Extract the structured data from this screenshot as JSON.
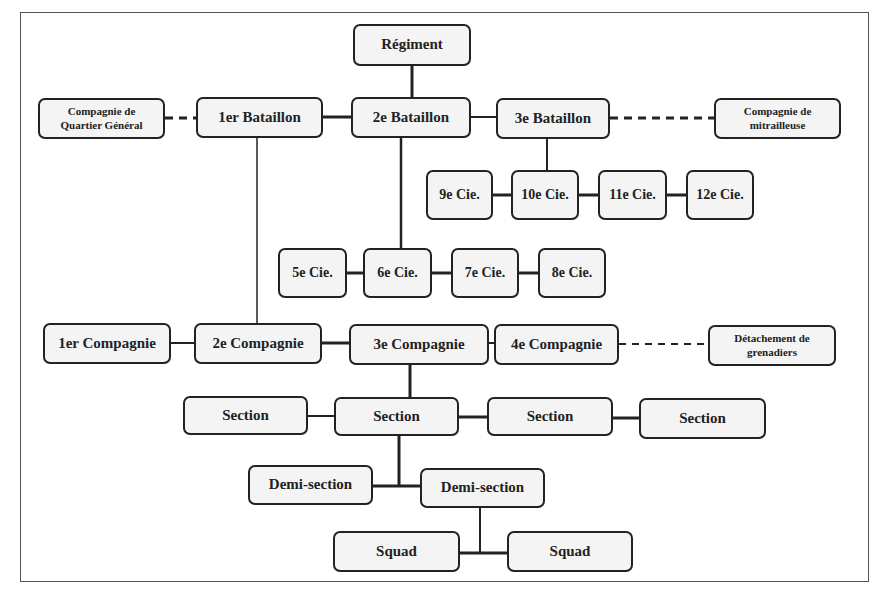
{
  "diagram": {
    "type": "organization-chart",
    "nodes": {
      "regiment": "Régiment",
      "qg_company": "Compagnie de Quartier Général",
      "bat1": "1er Bataillon",
      "bat2": "2e Bataillon",
      "bat3": "3e Bataillon",
      "mg_company": "Compagnie de mitrailleuse",
      "cie9": "9e Cie.",
      "cie10": "10e Cie.",
      "cie11": "11e Cie.",
      "cie12": "12e Cie.",
      "cie5": "5e Cie.",
      "cie6": "6e Cie.",
      "cie7": "7e Cie.",
      "cie8": "8e Cie.",
      "comp1": "1er Compagnie",
      "comp2": "2e Compagnie",
      "comp3": "3e Compagnie",
      "comp4": "4e Compagnie",
      "grenadiers": "Détachement de grenadiers",
      "section1": "Section",
      "section2": "Section",
      "section3": "Section",
      "section4": "Section",
      "demi1": "Demi-section",
      "demi2": "Demi-section",
      "squad1": "Squad",
      "squad2": "Squad"
    },
    "qg_lines": [
      "Compagnie de",
      "Quartier Général"
    ],
    "mg_lines": [
      "Compagnie de",
      "mitrailleuse"
    ],
    "grenadiers_lines": [
      "Détachement de",
      "grenadiers"
    ],
    "edges": [
      {
        "from": "regiment",
        "to": "bat2",
        "style": "solid"
      },
      {
        "from": "bat1",
        "to": "bat2",
        "style": "solid"
      },
      {
        "from": "bat2",
        "to": "bat3",
        "style": "solid"
      },
      {
        "from": "qg_company",
        "to": "bat1",
        "style": "dashed"
      },
      {
        "from": "bat3",
        "to": "mg_company",
        "style": "dashed"
      },
      {
        "from": "bat3",
        "to": "cie10",
        "style": "solid"
      },
      {
        "from": "cie9",
        "to": "cie10",
        "style": "solid"
      },
      {
        "from": "cie10",
        "to": "cie11",
        "style": "solid"
      },
      {
        "from": "cie11",
        "to": "cie12",
        "style": "solid"
      },
      {
        "from": "bat2",
        "to": "cie6",
        "style": "solid"
      },
      {
        "from": "cie5",
        "to": "cie6",
        "style": "solid"
      },
      {
        "from": "cie6",
        "to": "cie7",
        "style": "solid"
      },
      {
        "from": "cie7",
        "to": "cie8",
        "style": "solid"
      },
      {
        "from": "bat1",
        "to": "comp2",
        "style": "solid"
      },
      {
        "from": "comp1",
        "to": "comp2",
        "style": "solid"
      },
      {
        "from": "comp2",
        "to": "comp3",
        "style": "solid"
      },
      {
        "from": "comp3",
        "to": "comp4",
        "style": "solid"
      },
      {
        "from": "comp4",
        "to": "grenadiers",
        "style": "dashed"
      },
      {
        "from": "comp3",
        "to": "section2",
        "style": "solid"
      },
      {
        "from": "section1",
        "to": "section2",
        "style": "solid"
      },
      {
        "from": "section2",
        "to": "section3",
        "style": "solid"
      },
      {
        "from": "section3",
        "to": "section4",
        "style": "solid"
      },
      {
        "from": "section2",
        "to": "demi1",
        "style": "solid"
      },
      {
        "from": "section2",
        "to": "demi2",
        "style": "solid"
      },
      {
        "from": "demi2",
        "to": "squad1",
        "style": "solid"
      },
      {
        "from": "demi2",
        "to": "squad2",
        "style": "solid"
      }
    ]
  }
}
